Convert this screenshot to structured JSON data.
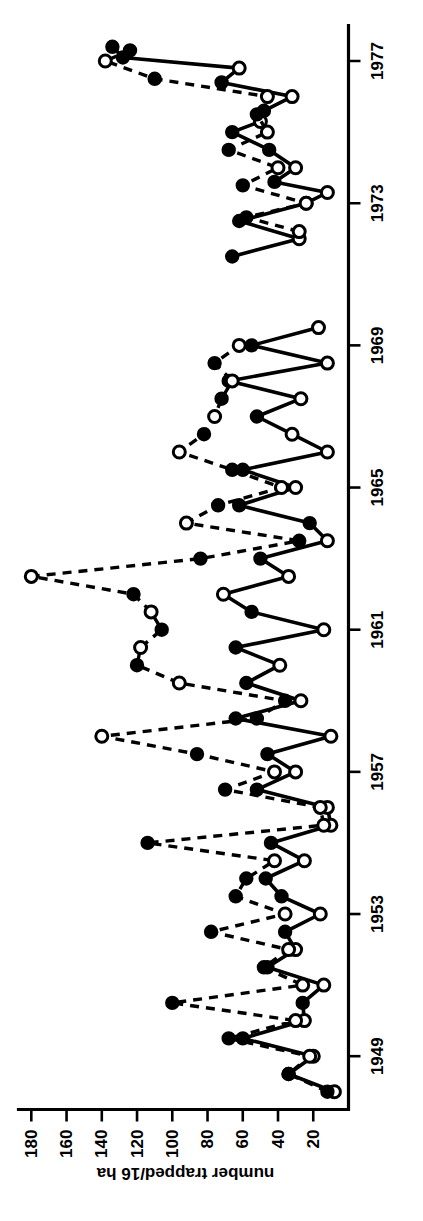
{
  "figure": {
    "background": "#ffffff",
    "ink": "#000000",
    "orientation_note": "printed upside-down (rotated 180 degrees)"
  },
  "chart_data": {
    "type": "line",
    "title": "",
    "subtitle": "",
    "xlabel": "",
    "ylabel": "number trapped/16 ha",
    "xlim": [
      1947.5,
      1978.0
    ],
    "ylim": [
      0,
      185
    ],
    "grid": false,
    "legend_position": "none",
    "x_tick_labels": [
      "1949",
      "1953",
      "1957",
      "1961",
      "1965",
      "1969",
      "1973",
      "1977"
    ],
    "x_ticks": [
      1949,
      1953,
      1957,
      1961,
      1965,
      1969,
      1973,
      1977
    ],
    "y_tick_labels": [
      "20",
      "40",
      "60",
      "80",
      "100",
      "120",
      "140",
      "160",
      "180"
    ],
    "y_ticks": [
      20,
      40,
      60,
      80,
      100,
      120,
      140,
      160,
      180
    ],
    "marker_scheme": {
      "filled_circle": "spring / first seasonal sample",
      "open_circle": "autumn / second seasonal sample"
    },
    "series": [
      {
        "name": "solid-line series",
        "linestyle": "solid",
        "color": "#000000",
        "points": [
          {
            "x": 1948.0,
            "y": 8,
            "marker": "open"
          },
          {
            "x": 1948.5,
            "y": 34,
            "marker": "filled"
          },
          {
            "x": 1949.0,
            "y": 20,
            "marker": "open"
          },
          {
            "x": 1949.5,
            "y": 60,
            "marker": "filled"
          },
          {
            "x": 1950.0,
            "y": 25,
            "marker": "open"
          },
          {
            "x": 1950.5,
            "y": 26,
            "marker": "filled"
          },
          {
            "x": 1951.0,
            "y": 14,
            "marker": "open"
          },
          {
            "x": 1951.5,
            "y": 46,
            "marker": "filled"
          },
          {
            "x": 1952.0,
            "y": 30,
            "marker": "open"
          },
          {
            "x": 1952.5,
            "y": 36,
            "marker": "filled"
          },
          {
            "x": 1953.0,
            "y": 16,
            "marker": "open"
          },
          {
            "x": 1953.5,
            "y": 38,
            "marker": "filled"
          },
          {
            "x": 1954.0,
            "y": 47,
            "marker": "filled"
          },
          {
            "x": 1954.5,
            "y": 25,
            "marker": "open"
          },
          {
            "x": 1955.0,
            "y": 44,
            "marker": "filled"
          },
          {
            "x": 1955.5,
            "y": 10,
            "marker": "open"
          },
          {
            "x": 1956.0,
            "y": 12,
            "marker": "open"
          },
          {
            "x": 1956.5,
            "y": 52,
            "marker": "filled"
          },
          {
            "x": 1957.0,
            "y": 30,
            "marker": "open"
          },
          {
            "x": 1957.5,
            "y": 46,
            "marker": "filled"
          },
          {
            "x": 1958.0,
            "y": 10,
            "marker": "open"
          },
          {
            "x": 1958.5,
            "y": 64,
            "marker": "filled"
          },
          {
            "x": 1959.0,
            "y": 27,
            "marker": "open"
          },
          {
            "x": 1959.5,
            "y": 58,
            "marker": "filled"
          },
          {
            "x": 1960.0,
            "y": 39,
            "marker": "open"
          },
          {
            "x": 1960.5,
            "y": 64,
            "marker": "filled"
          },
          {
            "x": 1961.0,
            "y": 14,
            "marker": "open"
          },
          {
            "x": 1961.5,
            "y": 55,
            "marker": "filled"
          },
          {
            "x": 1962.0,
            "y": 71,
            "marker": "open"
          },
          {
            "x": 1962.5,
            "y": 34,
            "marker": "open"
          },
          {
            "x": 1963.0,
            "y": 50,
            "marker": "filled"
          },
          {
            "x": 1963.5,
            "y": 12,
            "marker": "open"
          },
          {
            "x": 1964.0,
            "y": 22,
            "marker": "filled"
          },
          {
            "x": 1964.5,
            "y": 62,
            "marker": "filled"
          },
          {
            "x": 1965.0,
            "y": 30,
            "marker": "open"
          },
          {
            "x": 1965.5,
            "y": 60,
            "marker": "filled"
          },
          {
            "x": 1966.0,
            "y": 12,
            "marker": "open"
          },
          {
            "x": 1966.5,
            "y": 32,
            "marker": "open"
          },
          {
            "x": 1967.0,
            "y": 52,
            "marker": "filled"
          },
          {
            "x": 1967.5,
            "y": 27,
            "marker": "open"
          },
          {
            "x": 1968.0,
            "y": 68,
            "marker": "filled"
          },
          {
            "x": 1968.5,
            "y": 12,
            "marker": "open"
          },
          {
            "x": 1969.0,
            "y": 55,
            "marker": "filled"
          },
          {
            "x": 1969.5,
            "y": 17,
            "marker": "open"
          },
          {
            "x": 1971.5,
            "y": 66,
            "marker": "filled"
          },
          {
            "x": 1972.0,
            "y": 28,
            "marker": "open"
          },
          {
            "x": 1972.5,
            "y": 62,
            "marker": "filled"
          },
          {
            "x": 1973.0,
            "y": 24,
            "marker": "open"
          },
          {
            "x": 1973.3,
            "y": 12,
            "marker": "open"
          },
          {
            "x": 1973.6,
            "y": 42,
            "marker": "filled"
          },
          {
            "x": 1974.0,
            "y": 30,
            "marker": "open"
          },
          {
            "x": 1974.5,
            "y": 45,
            "marker": "filled"
          },
          {
            "x": 1975.0,
            "y": 66,
            "marker": "filled"
          },
          {
            "x": 1975.3,
            "y": 50,
            "marker": "open"
          },
          {
            "x": 1975.6,
            "y": 48,
            "marker": "filled"
          },
          {
            "x": 1976.0,
            "y": 32,
            "marker": "open"
          },
          {
            "x": 1976.4,
            "y": 72,
            "marker": "filled"
          },
          {
            "x": 1976.8,
            "y": 62,
            "marker": "open"
          },
          {
            "x": 1977.1,
            "y": 128,
            "marker": "filled"
          },
          {
            "x": 1977.4,
            "y": 134,
            "marker": "filled"
          }
        ]
      },
      {
        "name": "dashed-line series",
        "linestyle": "dashed",
        "color": "#000000",
        "points": [
          {
            "x": 1948.0,
            "y": 12,
            "marker": "filled"
          },
          {
            "x": 1948.5,
            "y": 34,
            "marker": "filled"
          },
          {
            "x": 1949.0,
            "y": 22,
            "marker": "open"
          },
          {
            "x": 1949.5,
            "y": 68,
            "marker": "filled"
          },
          {
            "x": 1950.0,
            "y": 30,
            "marker": "open"
          },
          {
            "x": 1950.5,
            "y": 100,
            "marker": "filled"
          },
          {
            "x": 1951.0,
            "y": 26,
            "marker": "open"
          },
          {
            "x": 1951.5,
            "y": 48,
            "marker": "filled"
          },
          {
            "x": 1952.0,
            "y": 34,
            "marker": "open"
          },
          {
            "x": 1952.5,
            "y": 78,
            "marker": "filled"
          },
          {
            "x": 1953.0,
            "y": 36,
            "marker": "open"
          },
          {
            "x": 1953.5,
            "y": 64,
            "marker": "filled"
          },
          {
            "x": 1954.0,
            "y": 58,
            "marker": "filled"
          },
          {
            "x": 1954.5,
            "y": 42,
            "marker": "open"
          },
          {
            "x": 1955.0,
            "y": 114,
            "marker": "filled"
          },
          {
            "x": 1955.5,
            "y": 14,
            "marker": "open"
          },
          {
            "x": 1956.0,
            "y": 16,
            "marker": "open"
          },
          {
            "x": 1956.5,
            "y": 70,
            "marker": "filled"
          },
          {
            "x": 1957.0,
            "y": 42,
            "marker": "open"
          },
          {
            "x": 1957.5,
            "y": 86,
            "marker": "filled"
          },
          {
            "x": 1958.0,
            "y": 140,
            "marker": "open"
          },
          {
            "x": 1958.5,
            "y": 52,
            "marker": "filled"
          },
          {
            "x": 1959.0,
            "y": 36,
            "marker": "filled"
          },
          {
            "x": 1959.5,
            "y": 96,
            "marker": "open"
          },
          {
            "x": 1960.0,
            "y": 120,
            "marker": "filled"
          },
          {
            "x": 1960.5,
            "y": 118,
            "marker": "open"
          },
          {
            "x": 1961.0,
            "y": 106,
            "marker": "filled"
          },
          {
            "x": 1961.5,
            "y": 112,
            "marker": "open"
          },
          {
            "x": 1962.0,
            "y": 122,
            "marker": "filled"
          },
          {
            "x": 1962.5,
            "y": 180,
            "marker": "open"
          },
          {
            "x": 1963.0,
            "y": 84,
            "marker": "filled"
          },
          {
            "x": 1963.5,
            "y": 28,
            "marker": "filled"
          },
          {
            "x": 1964.0,
            "y": 92,
            "marker": "open"
          },
          {
            "x": 1964.5,
            "y": 74,
            "marker": "filled"
          },
          {
            "x": 1965.0,
            "y": 38,
            "marker": "open"
          },
          {
            "x": 1965.5,
            "y": 66,
            "marker": "filled"
          },
          {
            "x": 1966.0,
            "y": 96,
            "marker": "open"
          },
          {
            "x": 1966.5,
            "y": 82,
            "marker": "filled"
          },
          {
            "x": 1967.0,
            "y": 76,
            "marker": "open"
          },
          {
            "x": 1967.5,
            "y": 72,
            "marker": "filled"
          },
          {
            "x": 1968.0,
            "y": 66,
            "marker": "open"
          },
          {
            "x": 1968.5,
            "y": 76,
            "marker": "filled"
          },
          {
            "x": 1969.0,
            "y": 62,
            "marker": "open"
          },
          {
            "x": 1972.2,
            "y": 28,
            "marker": "open"
          },
          {
            "x": 1972.6,
            "y": 58,
            "marker": "filled"
          },
          {
            "x": 1973.0,
            "y": 24,
            "marker": "open"
          },
          {
            "x": 1973.5,
            "y": 60,
            "marker": "filled"
          },
          {
            "x": 1974.0,
            "y": 40,
            "marker": "open"
          },
          {
            "x": 1974.5,
            "y": 68,
            "marker": "filled"
          },
          {
            "x": 1975.0,
            "y": 46,
            "marker": "open"
          },
          {
            "x": 1975.5,
            "y": 52,
            "marker": "filled"
          },
          {
            "x": 1976.0,
            "y": 46,
            "marker": "open"
          },
          {
            "x": 1976.5,
            "y": 110,
            "marker": "filled"
          },
          {
            "x": 1977.0,
            "y": 138,
            "marker": "open"
          },
          {
            "x": 1977.3,
            "y": 124,
            "marker": "filled"
          }
        ]
      }
    ]
  }
}
